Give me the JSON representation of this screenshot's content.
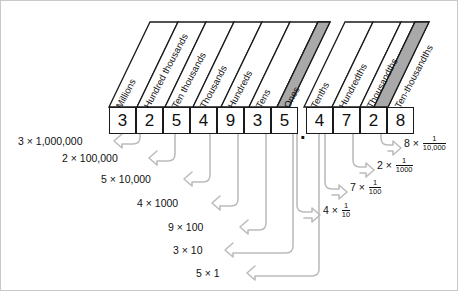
{
  "diagram": {
    "decimal_point": ".",
    "times_symbol": "×",
    "whole_columns": [
      {
        "label": "Millions",
        "digit": "3"
      },
      {
        "label": "Hundred thousands",
        "digit": "2"
      },
      {
        "label": "Ten thousands",
        "digit": "5"
      },
      {
        "label": "Thousands",
        "digit": "4"
      },
      {
        "label": "Hundreds",
        "digit": "9"
      },
      {
        "label": "Tens",
        "digit": "3"
      },
      {
        "label": "Ones",
        "digit": "5"
      }
    ],
    "decimal_columns": [
      {
        "label": "Tenths",
        "digit": "4"
      },
      {
        "label": "Hundredths",
        "digit": "7"
      },
      {
        "label": "Thousandths",
        "digit": "2"
      },
      {
        "label": "Ten-thousandths",
        "digit": "8"
      }
    ],
    "left_terms": [
      "3 × 1,000,000",
      "2 × 100,000",
      "5 × 10,000",
      "4 × 1000",
      "9 × 100",
      "3 × 10",
      "5 × 1"
    ],
    "right_terms": [
      {
        "coefficient": "8",
        "numerator": "1",
        "denominator": "10,000"
      },
      {
        "coefficient": "2",
        "numerator": "1",
        "denominator": "1000"
      },
      {
        "coefficient": "7",
        "numerator": "1",
        "denominator": "100"
      },
      {
        "coefficient": "4",
        "numerator": "1",
        "denominator": "10"
      }
    ],
    "colors": {
      "outline": "#1a1a1a",
      "arrow": "#bcbcbc",
      "side_face": "#a9a9a9",
      "frame": "#c9c9c9",
      "background": "#ffffff"
    }
  }
}
